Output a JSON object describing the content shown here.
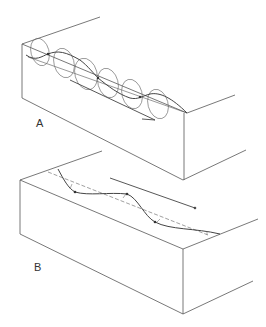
{
  "figure": {
    "panels": [
      {
        "id": "A",
        "label": "A",
        "description": "Block with circular orbital motion along a wave, arrow showing propagation direction"
      },
      {
        "id": "B",
        "label": "B",
        "description": "Block with sinuous wave displacement along a dashed axis, arrow showing propagation direction"
      }
    ],
    "corner_text": "",
    "colors": {
      "line": "#555555",
      "wave": "#444444",
      "dashed": "#777777"
    }
  }
}
